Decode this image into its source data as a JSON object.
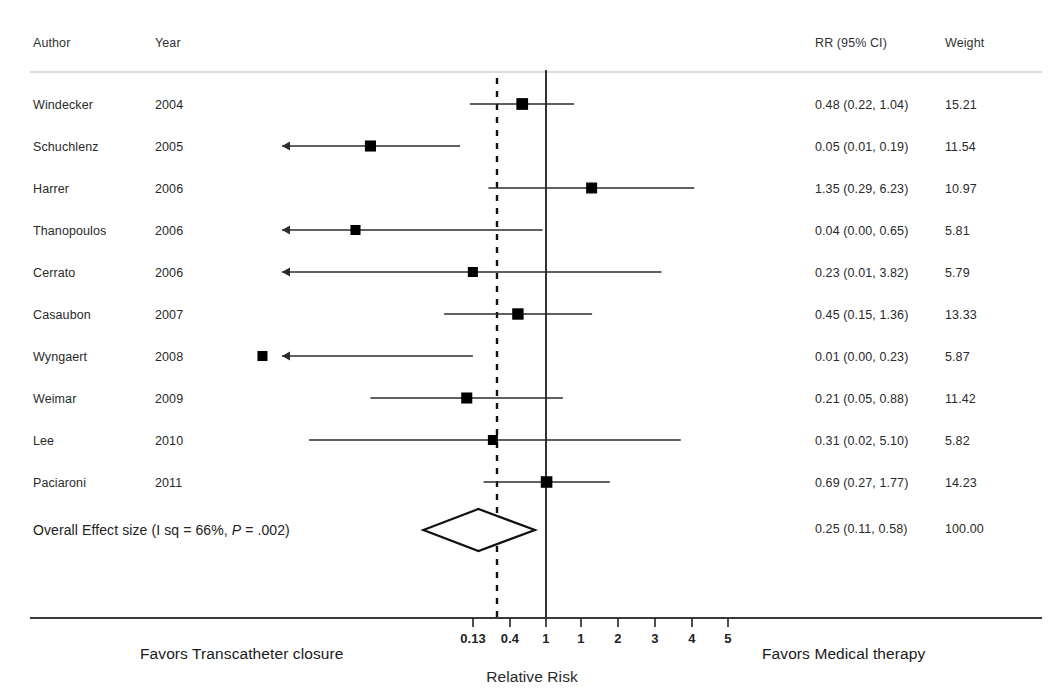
{
  "header": {
    "author": "Author",
    "year": "Year",
    "rr": "RR (95% CI)",
    "weight": "Weight"
  },
  "footer": {
    "left": "Favors Transcatheter closure",
    "right": "Favors Medical therapy",
    "axis_title": "Relative Risk"
  },
  "overall": {
    "label": "Overall Effect size (I sq = 66%, P = .002)",
    "label_pre": "Overall Effect size (I sq = 66%, ",
    "label_ital": "P",
    "label_post": " = .002)",
    "rr": "0.25 (0.11, 0.58)",
    "weight": "100.00",
    "estimate": 0.25,
    "ci_low": 0.11,
    "ci_high": 0.58
  },
  "colors": {
    "marker": "#000000",
    "line": "#2b2b2b",
    "rule": "#b9b9b9",
    "axis": "#3a3a3a",
    "diamond_fill": "#ffffff",
    "text": "#1f1f1f"
  },
  "chart_data": {
    "type": "forest",
    "title": "",
    "xlabel": "Relative Risk",
    "ylabel": "",
    "scale": "log",
    "null_line": 1,
    "pooled_line": 0.25,
    "xlim": [
      0.08,
      6.5
    ],
    "tick_values": [
      0.13,
      0.4,
      1,
      1,
      2,
      3,
      4,
      5
    ],
    "tick_labels": [
      "0.13",
      "0.4",
      "1",
      "1",
      "2",
      "3",
      "4",
      "5"
    ],
    "tick_px": [
      473,
      510,
      546,
      581,
      618,
      655,
      692,
      728
    ],
    "legend": [],
    "grid": false,
    "studies": [
      {
        "author": "Windecker",
        "year": "2004",
        "rr": 0.48,
        "low": 0.22,
        "high": 1.04,
        "rr_text": "0.48 (0.22, 1.04)",
        "weight": 15.21,
        "weight_text": "15.21"
      },
      {
        "author": "Schuchlenz",
        "year": "2005",
        "rr": 0.05,
        "low": 0.01,
        "high": 0.19,
        "rr_text": "0.05 (0.01, 0.19)",
        "weight": 11.54,
        "weight_text": "11.54"
      },
      {
        "author": "Harrer",
        "year": "2006",
        "rr": 1.35,
        "low": 0.29,
        "high": 6.23,
        "rr_text": "1.35 (0.29, 6.23)",
        "weight": 10.97,
        "weight_text": "10.97"
      },
      {
        "author": "Thanopoulos",
        "year": "2006",
        "rr": 0.04,
        "low": 0.0,
        "high": 0.65,
        "rr_text": "0.04 (0.00, 0.65)",
        "weight": 5.81,
        "weight_text": "5.81"
      },
      {
        "author": "Cerrato",
        "year": "2006",
        "rr": 0.23,
        "low": 0.01,
        "high": 3.82,
        "rr_text": "0.23 (0.01, 3.82)",
        "weight": 5.79,
        "weight_text": "5.79"
      },
      {
        "author": "Casaubon",
        "year": "2007",
        "rr": 0.45,
        "low": 0.15,
        "high": 1.36,
        "rr_text": "0.45 (0.15, 1.36)",
        "weight": 13.33,
        "weight_text": "13.33"
      },
      {
        "author": "Wyngaert",
        "year": "2008",
        "rr": 0.01,
        "low": 0.0,
        "high": 0.23,
        "rr_text": "0.01 (0.00, 0.23)",
        "weight": 5.87,
        "weight_text": "5.87"
      },
      {
        "author": "Weimar",
        "year": "2009",
        "rr": 0.21,
        "low": 0.05,
        "high": 0.88,
        "rr_text": "0.21 (0.05, 0.88)",
        "weight": 11.42,
        "weight_text": "11.42"
      },
      {
        "author": "Lee",
        "year": "2010",
        "rr": 0.31,
        "low": 0.02,
        "high": 5.1,
        "rr_text": "0.31 (0.02, 5.10)",
        "weight": 5.82,
        "weight_text": "5.82"
      },
      {
        "author": "Paciaroni",
        "year": "2011",
        "rr": 0.69,
        "low": 0.27,
        "high": 1.77,
        "rr_text": "0.69 (0.27, 1.77)",
        "weight": 14.23,
        "weight_text": "14.23"
      }
    ]
  },
  "geometry": {
    "header_y": 42,
    "rule_y": 72,
    "first_row_y": 104,
    "row_step": 42,
    "overall_row_y": 530,
    "axis_y": 618,
    "tick_len": 9,
    "null_x": 546,
    "pooled_x": 497,
    "plot_left": 30,
    "plot_right": 1040
  }
}
